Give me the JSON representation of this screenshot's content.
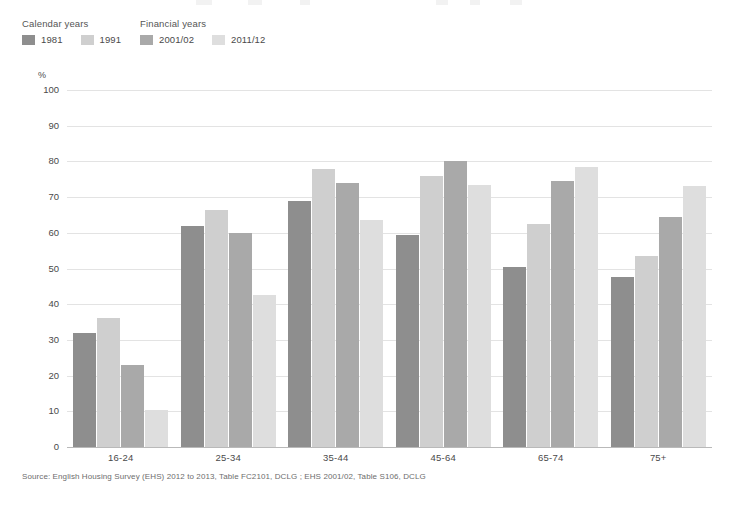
{
  "legend": {
    "groups": [
      {
        "title": "Calendar years",
        "items": [
          {
            "label": "1981",
            "color": "#8e8e8e"
          },
          {
            "label": "1991",
            "color": "#cfcfcf"
          }
        ]
      },
      {
        "title": "Financial years",
        "items": [
          {
            "label": "2001/02",
            "color": "#a9a9a9"
          },
          {
            "label": "2011/12",
            "color": "#dedede"
          }
        ]
      }
    ]
  },
  "axis": {
    "y_unit": "%",
    "y_ticks": [
      "100",
      "90",
      "80",
      "70",
      "60",
      "50",
      "40",
      "30",
      "20",
      "10",
      "0"
    ]
  },
  "source": {
    "text": "Source: English Housing Survey (EHS) 2012 to 2013, Table FC2101, DCLG ; EHS 2001/02, Table S106, DCLG"
  },
  "chart_data": {
    "type": "bar",
    "title": "",
    "subtitle": "",
    "xlabel": "",
    "ylabel": "%",
    "ylim": [
      0,
      100
    ],
    "ytick_step": 10,
    "grid": true,
    "legend_position": "top-left",
    "categories": [
      "16-24",
      "25-34",
      "35-44",
      "45-64",
      "65-74",
      "75+"
    ],
    "series": [
      {
        "name": "1981",
        "color": "#8e8e8e",
        "values": [
          32,
          62,
          69,
          59.5,
          50.5,
          47.5
        ]
      },
      {
        "name": "1991",
        "color": "#cfcfcf",
        "values": [
          36,
          66.5,
          78,
          76,
          62.5,
          53.5
        ]
      },
      {
        "name": "2001/02",
        "color": "#a9a9a9",
        "values": [
          23,
          60,
          74,
          80,
          74.5,
          64.5
        ]
      },
      {
        "name": "2011/12",
        "color": "#dedede",
        "values": [
          10.5,
          42.5,
          63.5,
          73.5,
          78.5,
          73
        ]
      }
    ]
  }
}
